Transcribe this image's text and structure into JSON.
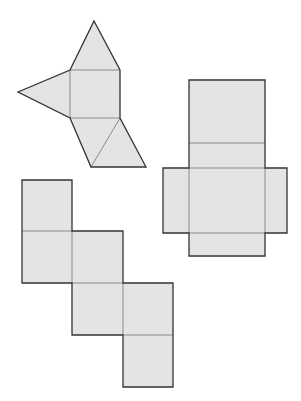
{
  "diagram": {
    "colors": {
      "background": "#ffffff",
      "face_fill": "#e4e4e4",
      "outer_edge": "#333333",
      "fold_line": "#8a8a8a"
    },
    "nets": [
      {
        "id": "pyramid-like-net",
        "faces": [
          {
            "name": "top-triangle",
            "points": "70,70 94,21 120,70"
          },
          {
            "name": "left-triangle",
            "points": "70,70 18,92 70,118"
          },
          {
            "name": "center-square",
            "points": "70,70 120,70 120,118 70,118"
          },
          {
            "name": "lower-left-triangle",
            "points": "70,118 120,118 91,167"
          },
          {
            "name": "lower-right-triangle",
            "points": "120,118 146,167 91,167"
          }
        ],
        "outline": "94,21 120,70 120,118 146,167 91,167 70,118 18,92 70,70",
        "folds": [
          "70,70 120,70",
          "70,70 70,118",
          "70,118 120,118",
          "120,118 91,167"
        ]
      },
      {
        "id": "cross-box-net",
        "faces": [
          {
            "name": "top-panel",
            "points": "189,80 265,80 265,143 189,143"
          },
          {
            "name": "upper-middle-panel",
            "points": "189,143 265,143 265,168 189,168"
          },
          {
            "name": "left-flap",
            "points": "163,168 189,168 189,233 163,233"
          },
          {
            "name": "center-panel",
            "points": "189,168 265,168 265,233 189,233"
          },
          {
            "name": "right-flap",
            "points": "265,168 287,168 287,233 265,233"
          },
          {
            "name": "bottom-panel",
            "points": "189,233 265,233 265,256 189,256"
          }
        ],
        "outline": "189,80 265,80 265,168 287,168 287,233 265,233 265,256 189,256 189,233 163,233 163,168 189,168",
        "folds": [
          "189,143 265,143",
          "189,168 265,168",
          "189,168 189,233",
          "265,168 265,233",
          "189,233 265,233"
        ]
      },
      {
        "id": "staircase-cube-net",
        "faces": [
          {
            "name": "square-1",
            "points": "22,180 72,180 72,231 22,231"
          },
          {
            "name": "square-2",
            "points": "22,231 72,231 72,283 22,283"
          },
          {
            "name": "square-3",
            "points": "72,231 123,231 123,283 72,283"
          },
          {
            "name": "square-4",
            "points": "72,283 123,283 123,335 72,335"
          },
          {
            "name": "square-5",
            "points": "123,283 173,283 173,335 123,335"
          },
          {
            "name": "square-6",
            "points": "123,335 173,335 173,387 123,387"
          }
        ],
        "outline": "22,180 72,180 72,231 123,231 123,283 173,283 173,387 123,387 123,335 72,335 72,283 22,283",
        "folds": [
          "22,231 72,231",
          "72,231 72,283",
          "72,283 123,283",
          "123,283 123,335",
          "123,335 173,335"
        ]
      }
    ]
  }
}
